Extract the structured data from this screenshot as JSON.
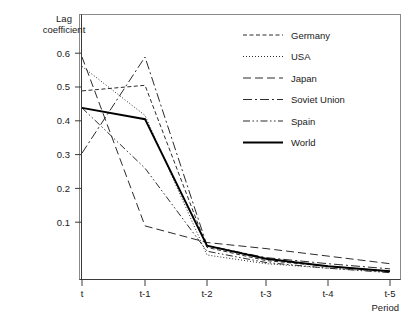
{
  "chart_data": {
    "type": "line",
    "title": "",
    "xlabel": "Period",
    "ylabel": "Lag coefficient",
    "ylabel_line1": "Lag",
    "ylabel_line2": "coefficient",
    "categories": [
      "t",
      "t-1",
      "t-2",
      "t-3",
      "t-4",
      "t-5"
    ],
    "x_tick_labels": [
      "t",
      "t-1",
      "t-2",
      "t-3",
      "t-4",
      "t-5"
    ],
    "y_tick_labels": [
      "0.1",
      "0.2",
      "0.3",
      "0.4",
      "0.5",
      "0.6"
    ],
    "y_tick_values": [
      0.1,
      0.2,
      0.3,
      0.4,
      0.5,
      0.6
    ],
    "ylim": [
      0.0,
      0.63
    ],
    "grid": false,
    "legend_position": "top-right inside",
    "series": [
      {
        "name": "Germany",
        "dash": "short-dash",
        "dasharray": "4,2.5",
        "values": [
          0.5,
          0.515,
          0.085,
          0.05,
          0.035,
          0.022
        ]
      },
      {
        "name": "USA",
        "dash": "dotted",
        "dasharray": "1,2",
        "values": [
          0.565,
          0.435,
          0.065,
          0.042,
          0.03,
          0.02
        ]
      },
      {
        "name": "Japan",
        "dash": "long-dash",
        "dasharray": "8,4",
        "values": [
          0.59,
          0.142,
          0.098,
          0.082,
          0.062,
          0.042
        ]
      },
      {
        "name": "Soviet Union",
        "dash": "dash-dot",
        "dasharray": "9,3,2,3",
        "values": [
          0.335,
          0.59,
          0.09,
          0.058,
          0.042,
          0.028
        ]
      },
      {
        "name": "Spain",
        "dash": "dash-dot-dot",
        "dasharray": "7,2.5,1.5,2.5,1.5,2.5",
        "values": [
          0.455,
          0.295,
          0.075,
          0.045,
          0.03,
          0.018
        ]
      },
      {
        "name": "World",
        "dash": "solid",
        "dasharray": "none",
        "values": [
          0.455,
          0.425,
          0.09,
          0.055,
          0.035,
          0.022
        ]
      }
    ],
    "legend_entries": [
      "Germany",
      "USA",
      "Japan",
      "Soviet Union",
      "Spain",
      "World"
    ]
  }
}
